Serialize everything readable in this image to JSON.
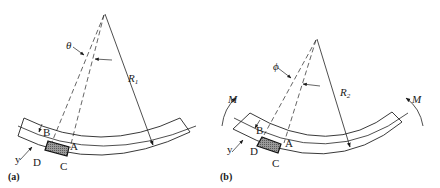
{
  "figure": {
    "panel_a": {
      "tag": "(a)",
      "angle_symbol": "θ",
      "radius_label": "R",
      "radius_subscript": "1",
      "points": {
        "A": "A",
        "B": "B",
        "C": "C",
        "D": "D"
      },
      "offset_label": "y"
    },
    "panel_b": {
      "tag": "(b)",
      "angle_symbol": "ϕ",
      "radius_label": "R",
      "radius_subscript": "2",
      "points": {
        "A": "A",
        "B": "B",
        "C": "C",
        "D": "D"
      },
      "offset_label": "y",
      "moment_left": "M",
      "moment_right": "M"
    }
  }
}
